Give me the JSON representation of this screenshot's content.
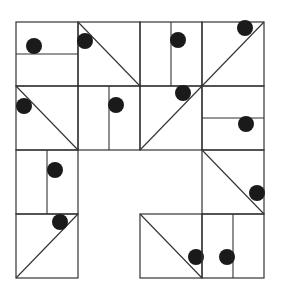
{
  "puzzle": {
    "description": "4x4 tiled grid with split cells and dots; three cells empty",
    "grid": {
      "cols_x": [
        16,
        78,
        140,
        202,
        264
      ],
      "rows_y": [
        22,
        86,
        150,
        214,
        278
      ]
    },
    "colors": {
      "line": "#333333",
      "dot": "#1a1a1a",
      "background": "#ffffff"
    },
    "cells": [
      {
        "row": 0,
        "col": 0,
        "split": "horizontal",
        "dot": [
          34,
          46
        ]
      },
      {
        "row": 0,
        "col": 1,
        "split": "diag-down",
        "dot": [
          85,
          41
        ]
      },
      {
        "row": 0,
        "col": 2,
        "split": "vertical",
        "dot": [
          178,
          40
        ]
      },
      {
        "row": 0,
        "col": 3,
        "split": "diag-up",
        "dot": [
          245,
          28
        ]
      },
      {
        "row": 1,
        "col": 0,
        "split": "diag-down",
        "dot": [
          24,
          106
        ]
      },
      {
        "row": 1,
        "col": 1,
        "split": "vertical",
        "dot": [
          116,
          105
        ]
      },
      {
        "row": 1,
        "col": 2,
        "split": "diag-up",
        "dot": [
          183,
          93
        ]
      },
      {
        "row": 1,
        "col": 3,
        "split": "horizontal",
        "dot": [
          246,
          124
        ]
      },
      {
        "row": 2,
        "col": 0,
        "split": "vertical",
        "dot": [
          55,
          170
        ]
      },
      {
        "row": 2,
        "col": 3,
        "split": "diag-down",
        "dot": [
          257,
          193
        ]
      },
      {
        "row": 3,
        "col": 0,
        "split": "diag-up",
        "dot": [
          60,
          222
        ]
      },
      {
        "row": 3,
        "col": 2,
        "split": "diag-down",
        "dot": [
          196,
          257
        ]
      },
      {
        "row": 3,
        "col": 3,
        "split": "vertical",
        "dot": [
          227,
          257
        ]
      }
    ],
    "empty_cells": [
      [
        2,
        1
      ],
      [
        2,
        2
      ],
      [
        3,
        1
      ]
    ],
    "dot_radius": 8
  }
}
